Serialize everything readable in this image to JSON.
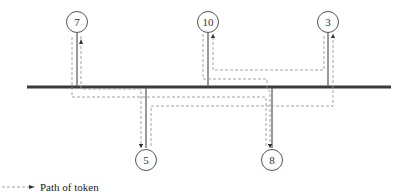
{
  "diagram": {
    "type": "token-bus",
    "colors": {
      "bus": "#3a3a3a",
      "stem": "#555555",
      "path": "#9a9a9a",
      "arrow": "#333333",
      "node_stroke": "#555555"
    },
    "nodes": [
      {
        "id": "7",
        "label": "7",
        "position": "top"
      },
      {
        "id": "10",
        "label": "10",
        "position": "top"
      },
      {
        "id": "3",
        "label": "3",
        "position": "top"
      },
      {
        "id": "5",
        "label": "5",
        "position": "bottom"
      },
      {
        "id": "8",
        "label": "8",
        "position": "bottom"
      }
    ],
    "token_order": [
      "10",
      "8",
      "7",
      "5",
      "3",
      "10"
    ],
    "legend": {
      "label": "Path of token"
    }
  }
}
